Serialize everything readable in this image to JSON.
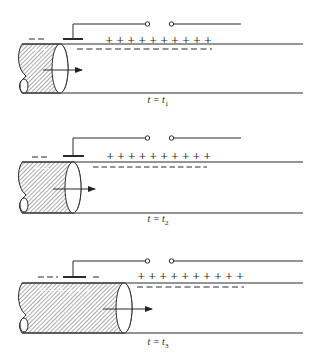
{
  "figure": {
    "panels": [
      {
        "label_var": "t = t",
        "label_sub": "1",
        "front_x": 60,
        "y": 0
      },
      {
        "label_var": "t = t",
        "label_sub": "2",
        "front_x": 73,
        "y": 118
      },
      {
        "label_var": "t = t",
        "label_sub": "3",
        "front_x": 124,
        "y": 240
      }
    ],
    "charges": {
      "positive": "+",
      "negative": "−"
    },
    "colors": {
      "ink": "#2a2a2a",
      "hatch": "#555555",
      "background": "#ffffff"
    }
  }
}
